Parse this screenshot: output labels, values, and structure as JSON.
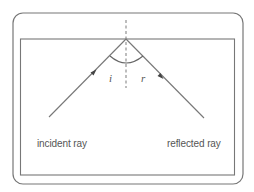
{
  "diagram": {
    "type": "reflection-of-light",
    "colors": {
      "line": "#777777",
      "text": "#555555",
      "background": "#ffffff"
    },
    "labels": {
      "incident_ray": "incident ray",
      "reflected_ray": "reflected ray",
      "angle_of_incidence": "i",
      "angle_of_reflection": "r"
    },
    "elements": {
      "outer_frame": "rounded rectangle",
      "mirror_surface": "horizontal line (top edge of inner rectangle)",
      "normal": "vertical dashed line",
      "incident_ray": "arrow toward mirror",
      "reflected_ray": "arrow away from mirror",
      "angle_arc": "arc between rays"
    }
  }
}
